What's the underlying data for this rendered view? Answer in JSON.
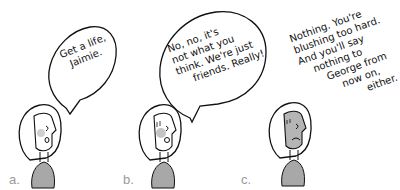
{
  "panels": [
    {
      "label": "a.",
      "speech_type": "bubble",
      "lines": [
        "Get a life,",
        "Jaimie."
      ],
      "expression": "surprised"
    },
    {
      "label": "b.",
      "speech_type": "bubble",
      "lines": [
        "No, no, it's",
        "not what you",
        "think. We're just",
        "friends. Really!"
      ],
      "expression": "surprised-blushing"
    },
    {
      "label": "c.",
      "speech_type": "thought-text",
      "lines": [
        "Nothing. You're",
        "blushing too hard.",
        "And you'll say",
        "nothing to",
        "George from",
        "now on,",
        "either."
      ],
      "expression": "frowning-shaded"
    }
  ],
  "colors": {
    "ink": "#111111",
    "shirt": "#a8a8a8",
    "blush": "#cfcfcf",
    "shade": "#b5b5b5",
    "label": "#9a9a9a"
  }
}
